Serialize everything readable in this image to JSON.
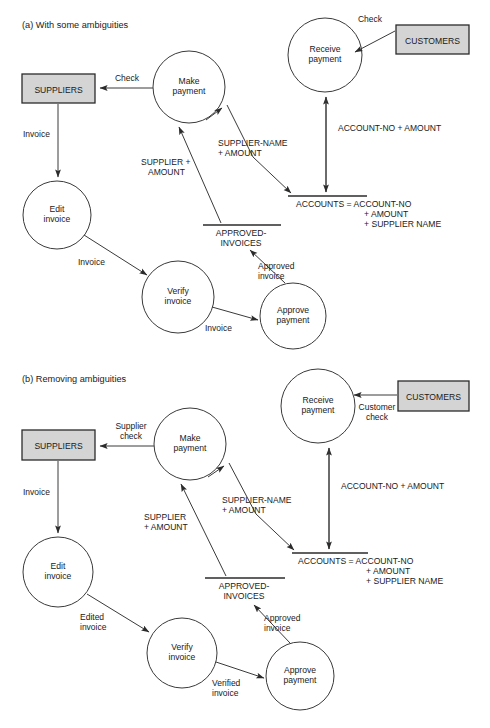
{
  "figure": {
    "panels": [
      {
        "id": "panel-a",
        "caption": "(a) With some ambiguities",
        "external_entities": [
          {
            "id": "suppliers",
            "label": "SUPPLIERS"
          },
          {
            "id": "customers",
            "label": "CUSTOMERS"
          }
        ],
        "processes": [
          {
            "id": "make-payment",
            "line1": "Make",
            "line2": "payment"
          },
          {
            "id": "receive-payment",
            "line1": "Receive",
            "line2": "payment"
          },
          {
            "id": "edit-invoice",
            "line1": "Edit",
            "line2": "invoice"
          },
          {
            "id": "verify-invoice",
            "line1": "Verify",
            "line2": "invoice"
          },
          {
            "id": "approve-payment",
            "line1": "Approve",
            "line2": "payment"
          }
        ],
        "data_stores": [
          {
            "id": "accounts",
            "line1": "ACCOUNTS =  ACCOUNT-NO",
            "line2": "+ AMOUNT",
            "line3": "+ SUPPLIER NAME"
          },
          {
            "id": "approved-invoices",
            "line1": "APPROVED-",
            "line2": "INVOICES"
          }
        ],
        "flows": [
          {
            "id": "make-to-suppliers",
            "label": "Check"
          },
          {
            "id": "customers-to-receive",
            "label": "Check"
          },
          {
            "id": "suppliers-to-edit",
            "label": "Invoice"
          },
          {
            "id": "edit-to-verify",
            "label": "Invoice"
          },
          {
            "id": "verify-to-approve",
            "label": "Invoice"
          },
          {
            "id": "approve-to-approved-invoices",
            "line1": "Approved",
            "line2": "invoice"
          },
          {
            "id": "approved-invoices-to-make",
            "line1": "SUPPLIER +",
            "line2": "AMOUNT"
          },
          {
            "id": "accounts-to-make",
            "line1": "SUPPLIER-NAME",
            "line2": "+ AMOUNT"
          },
          {
            "id": "receive-accounts",
            "label": "ACCOUNT-NO + AMOUNT"
          }
        ]
      },
      {
        "id": "panel-b",
        "caption": "(b) Removing ambiguities",
        "external_entities": [
          {
            "id": "suppliers",
            "label": "SUPPLIERS"
          },
          {
            "id": "customers",
            "label": "CUSTOMERS"
          }
        ],
        "processes": [
          {
            "id": "make-payment",
            "line1": "Make",
            "line2": "payment"
          },
          {
            "id": "receive-payment",
            "line1": "Receive",
            "line2": "payment"
          },
          {
            "id": "edit-invoice",
            "line1": "Edit",
            "line2": "invoice"
          },
          {
            "id": "verify-invoice",
            "line1": "Verify",
            "line2": "invoice"
          },
          {
            "id": "approve-payment",
            "line1": "Approve",
            "line2": "payment"
          }
        ],
        "data_stores": [
          {
            "id": "accounts",
            "line1": "ACCOUNTS =  ACCOUNT-NO",
            "line2": "+ AMOUNT",
            "line3": "+ SUPPLIER NAME"
          },
          {
            "id": "approved-invoices",
            "line1": "APPROVED-",
            "line2": "INVOICES"
          }
        ],
        "flows": [
          {
            "id": "make-to-suppliers",
            "line1": "Supplier",
            "line2": "check"
          },
          {
            "id": "customers-to-receive",
            "line1": "Customer",
            "line2": "check"
          },
          {
            "id": "suppliers-to-edit",
            "label": "Invoice"
          },
          {
            "id": "edit-to-verify",
            "line1": "Edited",
            "line2": "invoice"
          },
          {
            "id": "verify-to-approve",
            "line1": "Verified",
            "line2": "invoice"
          },
          {
            "id": "approve-to-approved-invoices",
            "line1": "Approved",
            "line2": "invoice"
          },
          {
            "id": "approved-invoices-to-make",
            "line1": "SUPPLIER",
            "line2": "+ AMOUNT"
          },
          {
            "id": "accounts-to-make",
            "line1": "SUPPLIER-NAME",
            "line2": "+ AMOUNT"
          },
          {
            "id": "receive-accounts",
            "label": "ACCOUNT-NO + AMOUNT"
          }
        ]
      }
    ],
    "colors": {
      "entity_fill": "#d4d4d4",
      "stroke": "#2b2b2b",
      "background": "#ffffff"
    }
  }
}
